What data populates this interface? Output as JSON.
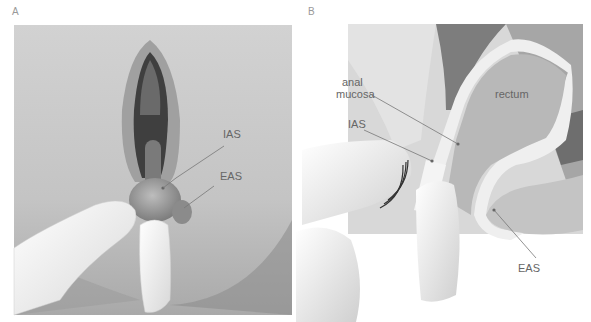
{
  "panels": [
    {
      "letter": "A",
      "labels": {
        "ias": "IAS",
        "eas": "EAS"
      }
    },
    {
      "letter": "B",
      "labels": {
        "anal_mucosa_line1": "anal",
        "anal_mucosa_line2": "mucosa",
        "rectum": "rectum",
        "ias": "IAS",
        "eas": "EAS"
      }
    }
  ]
}
